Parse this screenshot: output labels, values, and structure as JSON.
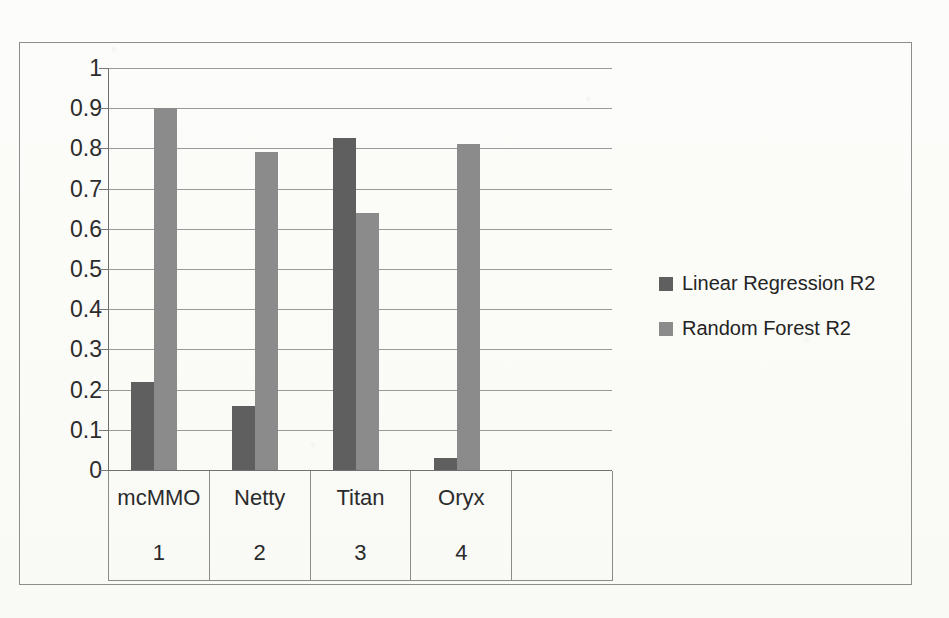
{
  "chart_data": {
    "type": "bar",
    "title": "",
    "subtitle": "",
    "xlabel": "",
    "ylabel": "",
    "categories": [
      "mcMMO",
      "Netty",
      "Titan",
      "Oryx",
      ""
    ],
    "category_indices": [
      "1",
      "2",
      "3",
      "4",
      ""
    ],
    "series": [
      {
        "name": "Linear Regression R2",
        "color": "#5f5f5f",
        "values": [
          0.22,
          0.16,
          0.825,
          0.03,
          null
        ]
      },
      {
        "name": "Random Forest R2",
        "color": "#8b8b8b",
        "values": [
          0.9,
          0.79,
          0.64,
          0.81,
          null
        ]
      }
    ],
    "ylim": [
      0,
      1
    ],
    "ytick_labels": [
      "1",
      "0.9",
      "0.8",
      "0.7",
      "0.6",
      "0.5",
      "0.4",
      "0.3",
      "0.2",
      "0.1",
      "0"
    ],
    "ytick_values": [
      1,
      0.9,
      0.8,
      0.7,
      0.6,
      0.5,
      0.4,
      0.3,
      0.2,
      0.1,
      0
    ],
    "grid": true,
    "legend_position": "right",
    "legend_entries": [
      "Linear Regression R2",
      "Random Forest R2"
    ]
  },
  "legend": {
    "items": [
      {
        "label": "Linear Regression R2"
      },
      {
        "label": "Random Forest R2"
      }
    ]
  },
  "background_artifacts": [
    "photocopy bleed-through text",
    "scan speckle"
  ]
}
